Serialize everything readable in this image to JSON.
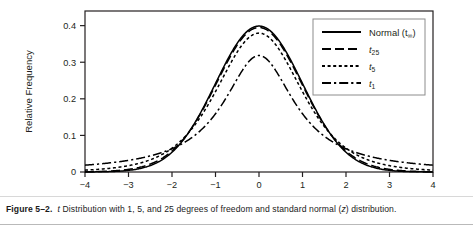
{
  "figure": {
    "caption_number": "Figure 5–2.",
    "caption_lead_italic": "t",
    "caption_text": " Distribution with 1, 5, and 25 degrees of freedom and standard normal (",
    "caption_italic_z": "z",
    "caption_tail": ") distribution."
  },
  "chart_data": {
    "type": "line",
    "title": "",
    "subtitle": "",
    "xlabel": "",
    "ylabel": "Relative Frequency",
    "xlim": [
      -4,
      4
    ],
    "ylim": [
      0,
      0.44
    ],
    "grid": false,
    "legend_position": "top-right",
    "xticks": [
      -4,
      -3,
      -2,
      -1,
      0,
      1,
      2,
      3,
      4
    ],
    "xtick_labels": [
      "−4",
      "−3",
      "−2",
      "−1",
      "0",
      "1",
      "2",
      "3",
      "4"
    ],
    "yticks": [
      0,
      0.1,
      0.2,
      0.3,
      0.4
    ],
    "ytick_labels": [
      "0",
      "0.1",
      "0.2",
      "0.3",
      "0.4"
    ],
    "x": [
      -4,
      -3.8,
      -3.6,
      -3.4,
      -3.2,
      -3,
      -2.8,
      -2.6,
      -2.4,
      -2.2,
      -2,
      -1.8,
      -1.6,
      -1.4,
      -1.2,
      -1,
      -0.8,
      -0.6,
      -0.4,
      -0.2,
      0,
      0.2,
      0.4,
      0.6,
      0.8,
      1,
      1.2,
      1.4,
      1.6,
      1.8,
      2,
      2.2,
      2.4,
      2.6,
      2.8,
      3,
      3.2,
      3.4,
      3.6,
      3.8,
      4
    ],
    "series": [
      {
        "name": "Normal (t∞)",
        "name_base": "Normal (t",
        "name_sub": "∞",
        "name_close": ")",
        "dash": "solid",
        "color": "#000000",
        "values": [
          0.0001,
          0.0003,
          0.0006,
          0.0012,
          0.0024,
          0.0044,
          0.0079,
          0.0136,
          0.0224,
          0.0355,
          0.054,
          0.079,
          0.1109,
          0.1497,
          0.1942,
          0.242,
          0.2897,
          0.3332,
          0.3683,
          0.391,
          0.3989,
          0.391,
          0.3683,
          0.3332,
          0.2897,
          0.242,
          0.1942,
          0.1497,
          0.1109,
          0.079,
          0.054,
          0.0355,
          0.0224,
          0.0136,
          0.0079,
          0.0044,
          0.0024,
          0.0012,
          0.0006,
          0.0003,
          0.0001
        ]
      },
      {
        "name": "t25",
        "name_base": "t",
        "name_sub": "25",
        "dash": "longdash",
        "color": "#000000",
        "values": [
          0.0004,
          0.0007,
          0.0012,
          0.0021,
          0.0035,
          0.0058,
          0.0096,
          0.0156,
          0.0248,
          0.0381,
          0.0566,
          0.0811,
          0.112,
          0.1489,
          0.1907,
          0.2353,
          0.2797,
          0.3201,
          0.3526,
          0.3735,
          0.3808,
          0.3735,
          0.3526,
          0.3201,
          0.2797,
          0.2353,
          0.1907,
          0.1489,
          0.112,
          0.0811,
          0.0566,
          0.0381,
          0.0248,
          0.0156,
          0.0096,
          0.0058,
          0.0035,
          0.0021,
          0.0012,
          0.0007,
          0.0004
        ]
      },
      {
        "name": "t5",
        "name_base": "t",
        "name_sub": "5",
        "dash": "shortdash",
        "color": "#000000",
        "values": [
          0.0051,
          0.0066,
          0.0086,
          0.0113,
          0.015,
          0.0201,
          0.0272,
          0.0371,
          0.0509,
          0.0699,
          0.0956,
          0.1288,
          0.1698,
          0.2169,
          0.2659,
          0.3097,
          0.3417,
          0.3579,
          0.3589,
          0.3497,
          0.3796,
          0.3497,
          0.3589,
          0.3579,
          0.3417,
          0.3097,
          0.2659,
          0.2169,
          0.1698,
          0.1288,
          0.0956,
          0.0699,
          0.0509,
          0.0371,
          0.0272,
          0.0201,
          0.015,
          0.0113,
          0.0086,
          0.0066,
          0.0051
        ]
      },
      {
        "name": "t1",
        "name_base": "t",
        "name_sub": "1",
        "dash": "dashdot",
        "color": "#000000",
        "values": [
          0.0187,
          0.0213,
          0.0243,
          0.0279,
          0.0322,
          0.0374,
          0.0437,
          0.0515,
          0.0612,
          0.0734,
          0.0889,
          0.1086,
          0.1334,
          0.164,
          0.2002,
          0.2387,
          0.2718,
          0.2914,
          0.2909,
          0.2788,
          0.3183,
          0.2788,
          0.2909,
          0.2914,
          0.2718,
          0.2387,
          0.2002,
          0.164,
          0.1334,
          0.1086,
          0.0889,
          0.0734,
          0.0612,
          0.0515,
          0.0437,
          0.0374,
          0.0322,
          0.0279,
          0.0243,
          0.0213,
          0.0187
        ]
      }
    ],
    "peak_values": {
      "normal": 0.399,
      "t25": 0.39,
      "t5": 0.333,
      "t1": 0.306
    },
    "tail_values_at_minus4": {
      "normal": 0.0001,
      "t25": 0.004,
      "t5": 0.008,
      "t1": 0.026
    }
  }
}
